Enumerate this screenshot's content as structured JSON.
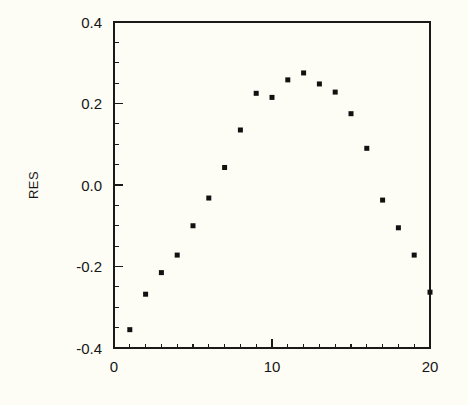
{
  "chart_data": {
    "type": "scatter",
    "title": "",
    "subtitle": "",
    "xlabel": "",
    "ylabel": "RES",
    "xlim": [
      0,
      20
    ],
    "ylim": [
      -0.4,
      0.4
    ],
    "grid": false,
    "legend": null,
    "x_ticks_major": [
      0,
      10,
      20
    ],
    "x_tick_labels": [
      "0",
      "10",
      "20"
    ],
    "x_ticks_minor_step": 1,
    "y_ticks_major": [
      -0.4,
      -0.2,
      0.0,
      0.2,
      0.4
    ],
    "y_tick_labels": [
      "-0.4",
      "-0.2",
      "0.0",
      "0.2",
      "0.4"
    ],
    "marker": "square",
    "marker_color": "#111111",
    "marker_size": 5,
    "x": [
      1,
      2,
      3,
      4,
      5,
      6,
      7,
      8,
      9,
      10,
      11,
      12,
      13,
      14,
      15,
      16,
      17,
      18,
      19,
      20
    ],
    "y": [
      -0.355,
      -0.268,
      -0.215,
      -0.172,
      -0.1,
      -0.032,
      0.043,
      0.135,
      0.225,
      0.215,
      0.258,
      0.275,
      0.248,
      0.228,
      0.175,
      0.09,
      -0.037,
      -0.105,
      -0.172,
      -0.263
    ],
    "series": [
      {
        "name": "RES",
        "x": [
          1,
          2,
          3,
          4,
          5,
          6,
          7,
          8,
          9,
          10,
          11,
          12,
          13,
          14,
          15,
          16,
          17,
          18,
          19,
          20
        ],
        "values": [
          -0.355,
          -0.268,
          -0.215,
          -0.172,
          -0.1,
          -0.032,
          0.043,
          0.135,
          0.225,
          0.215,
          0.258,
          0.275,
          0.248,
          0.228,
          0.175,
          0.09,
          -0.037,
          -0.105,
          -0.172,
          -0.263
        ]
      }
    ]
  },
  "axes": {
    "y_axis_title": "RES"
  },
  "colors": {
    "background": "#fdfdf5",
    "axis": "#1a1a1a",
    "marker": "#111111",
    "text": "#161616"
  }
}
